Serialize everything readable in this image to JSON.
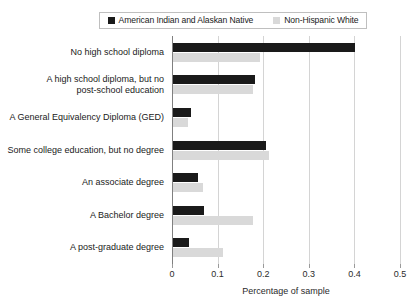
{
  "chart_data": {
    "type": "bar",
    "orientation": "horizontal",
    "title": "",
    "xlabel": "Percentage of sample",
    "ylabel": "",
    "xlim": [
      0,
      0.5
    ],
    "xticks": [
      "0",
      "0.1",
      "0.2",
      "0.3",
      "0.4",
      "0.5"
    ],
    "xtick_values": [
      0,
      0.1,
      0.2,
      0.3,
      0.4,
      0.5
    ],
    "grid": true,
    "legend_position": "top",
    "categories": [
      "No high school diploma",
      "A high school diploma, but no\npost-school education",
      "A General Equivalency Diploma (GED)",
      "Some college education, but no degree",
      "An associate degree",
      "A Bachelor degree",
      "A post-graduate degree"
    ],
    "series": [
      {
        "name": "American Indian and Alaskan Native",
        "color": "#1a1a1a",
        "values": [
          0.4,
          0.18,
          0.04,
          0.205,
          0.055,
          0.068,
          0.035
        ]
      },
      {
        "name": "Non-Hispanic White",
        "color": "#d9d9d9",
        "values": [
          0.19,
          0.175,
          0.032,
          0.21,
          0.065,
          0.175,
          0.11
        ]
      }
    ]
  },
  "legend": {
    "entries": [
      {
        "label": "American Indian and Alaskan Native",
        "color": "#1a1a1a"
      },
      {
        "label": "Non-Hispanic White",
        "color": "#d9d9d9"
      }
    ]
  }
}
